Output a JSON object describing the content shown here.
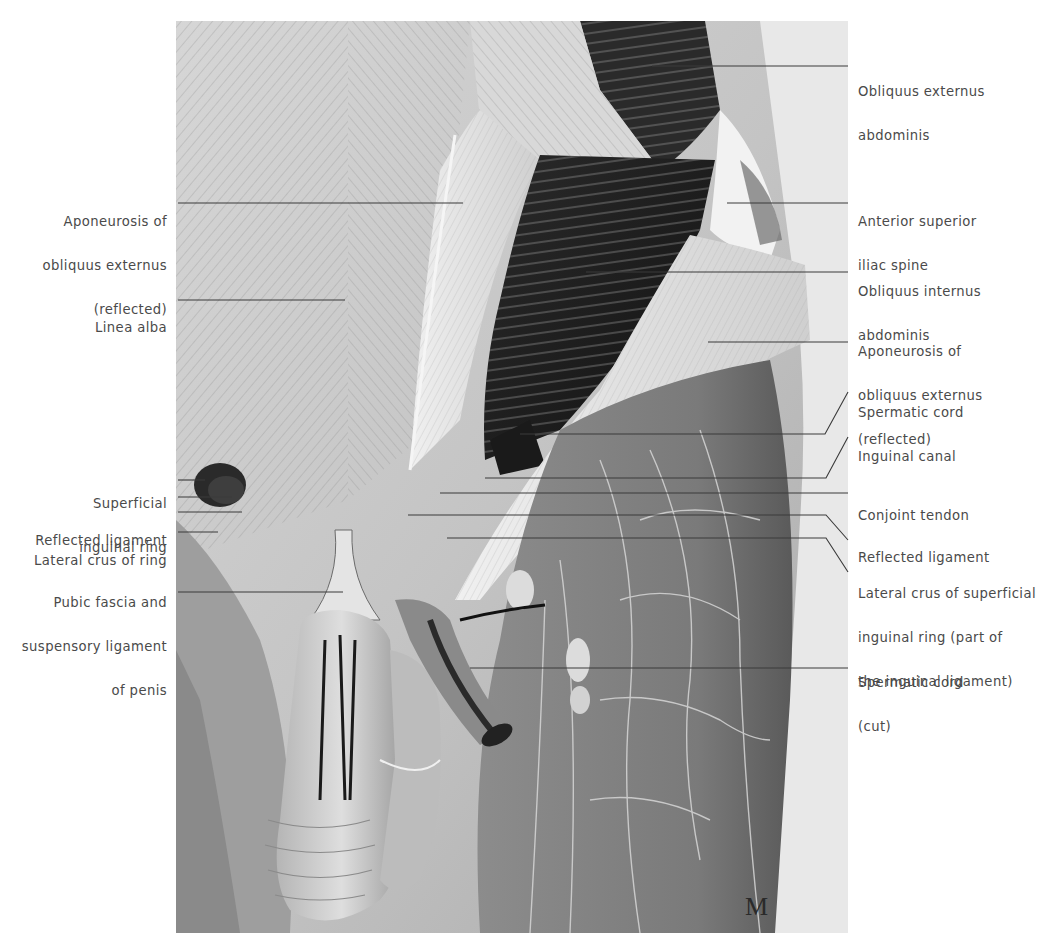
{
  "figure": {
    "type": "anatomical-illustration",
    "signature": "M",
    "colors": {
      "background": "#ffffff",
      "label_text": "#4a4a4a",
      "leader_line": "#3a3a3a",
      "muscle_dark": "#1e1e1e",
      "fascia_light": "#e6e6e6",
      "skin_mid": "#9a9a9a"
    }
  },
  "labels": {
    "left": [
      {
        "id": "aponeurosis-obliquus-externus-left",
        "lines": [
          "Aponeurosis of",
          "obliquus externus",
          "(reflected)"
        ]
      },
      {
        "id": "linea-alba",
        "lines": [
          "Linea alba"
        ]
      },
      {
        "id": "superficial-inguinal-ring",
        "lines": [
          "Superficial",
          "inguinal ring"
        ]
      },
      {
        "id": "reflected-ligament-left",
        "lines": [
          "Reflected ligament"
        ]
      },
      {
        "id": "lateral-crus-of-ring",
        "lines": [
          "Lateral crus of ring"
        ]
      },
      {
        "id": "pubic-fascia",
        "lines": [
          "Pubic fascia and",
          "suspensory ligament",
          "of penis"
        ]
      }
    ],
    "right": [
      {
        "id": "obliquus-externus-abdominis",
        "lines": [
          "Obliquus externus",
          "abdominis"
        ]
      },
      {
        "id": "anterior-superior-iliac-spine",
        "lines": [
          "Anterior superior",
          "iliac spine"
        ]
      },
      {
        "id": "obliquus-internus-abdominis",
        "lines": [
          "Obliquus internus",
          "abdominis"
        ]
      },
      {
        "id": "aponeurosis-obliquus-externus-right",
        "lines": [
          "Aponeurosis of",
          "obliquus externus",
          "(reflected)"
        ]
      },
      {
        "id": "spermatic-cord",
        "lines": [
          "Spermatic cord"
        ]
      },
      {
        "id": "inguinal-canal",
        "lines": [
          "Inguinal canal"
        ]
      },
      {
        "id": "conjoint-tendon",
        "lines": [
          "Conjoint tendon"
        ]
      },
      {
        "id": "reflected-ligament-right",
        "lines": [
          "Reflected ligament"
        ]
      },
      {
        "id": "lateral-crus-superficial-inguinal-ring",
        "lines": [
          "Lateral crus of superficial",
          "inguinal ring (part of",
          "the inguinal ligament)"
        ]
      },
      {
        "id": "spermatic-cord-cut",
        "lines": [
          "Spermatic cord",
          "(cut)"
        ]
      }
    ]
  }
}
